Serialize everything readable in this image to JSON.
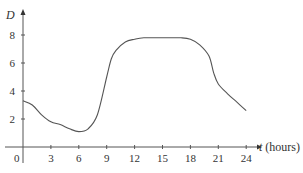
{
  "chart_data": {
    "type": "line",
    "title": "",
    "xlabel": "t (hours)",
    "ylabel": "D",
    "x_axis_var": "t",
    "x_axis_unit": "(hours)",
    "xlim": [
      0,
      25
    ],
    "ylim": [
      0,
      9
    ],
    "xticks": [
      0,
      3,
      6,
      9,
      12,
      15,
      18,
      21,
      24
    ],
    "yticks": [
      2,
      4,
      6,
      8
    ],
    "grid": false,
    "legend": null,
    "series": [
      {
        "name": "D(t)",
        "x": [
          0,
          1,
          2,
          3,
          4,
          5,
          6,
          7,
          8,
          9,
          9.5,
          10,
          11,
          12,
          13,
          15,
          17,
          18,
          19,
          20,
          20.5,
          21,
          22,
          23,
          24
        ],
        "values": [
          3.3,
          3.0,
          2.3,
          1.8,
          1.6,
          1.3,
          1.1,
          1.3,
          2.3,
          5.0,
          6.3,
          6.9,
          7.5,
          7.7,
          7.8,
          7.8,
          7.8,
          7.7,
          7.3,
          6.5,
          5.3,
          4.5,
          3.8,
          3.2,
          2.6
        ]
      }
    ]
  },
  "labels": {
    "y_axis": "D",
    "x_axis_var": "t",
    "x_axis_unit": "(hours)",
    "origin": "0"
  }
}
